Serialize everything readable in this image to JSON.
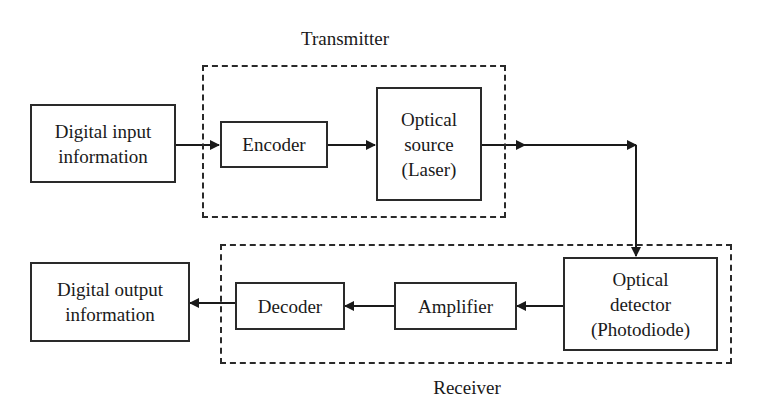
{
  "diagram": {
    "groups": {
      "transmitter": {
        "label": "Transmitter"
      },
      "receiver": {
        "label": "Receiver"
      }
    },
    "blocks": {
      "digital_input": {
        "lines": [
          "Digital input",
          "information"
        ]
      },
      "encoder": {
        "lines": [
          "Encoder"
        ]
      },
      "optical_source": {
        "lines": [
          "Optical",
          "source",
          "(Laser)"
        ]
      },
      "optical_detector": {
        "lines": [
          "Optical",
          "detector",
          "(Photodiode)"
        ]
      },
      "amplifier": {
        "lines": [
          "Amplifier"
        ]
      },
      "decoder": {
        "lines": [
          "Decoder"
        ]
      },
      "digital_output": {
        "lines": [
          "Digital output",
          "information"
        ]
      }
    },
    "connections": [
      {
        "from": "Digital input information",
        "to": "Encoder"
      },
      {
        "from": "Encoder",
        "to": "Optical source (Laser)"
      },
      {
        "from": "Optical source (Laser)",
        "to": "Optical detector (Photodiode)"
      },
      {
        "from": "Optical detector (Photodiode)",
        "to": "Amplifier"
      },
      {
        "from": "Amplifier",
        "to": "Decoder"
      },
      {
        "from": "Decoder",
        "to": "Digital output information"
      }
    ],
    "colors": {
      "stroke": "#2a2a2a",
      "background": "#ffffff"
    }
  }
}
